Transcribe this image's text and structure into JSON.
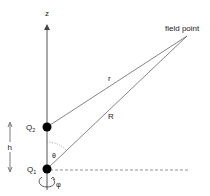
{
  "diagram": {
    "axis_label": "z",
    "field_point_label": "field point",
    "r_label": "r",
    "R_label": "R",
    "theta_label": "θ",
    "phi_label": "φ",
    "h_label": "h",
    "q2_label": "Q",
    "q2_sub": "2",
    "q1_label": "Q",
    "q1_sub": "1",
    "colors": {
      "line": "#555555",
      "dot": "#000000",
      "text": "#222222"
    }
  }
}
